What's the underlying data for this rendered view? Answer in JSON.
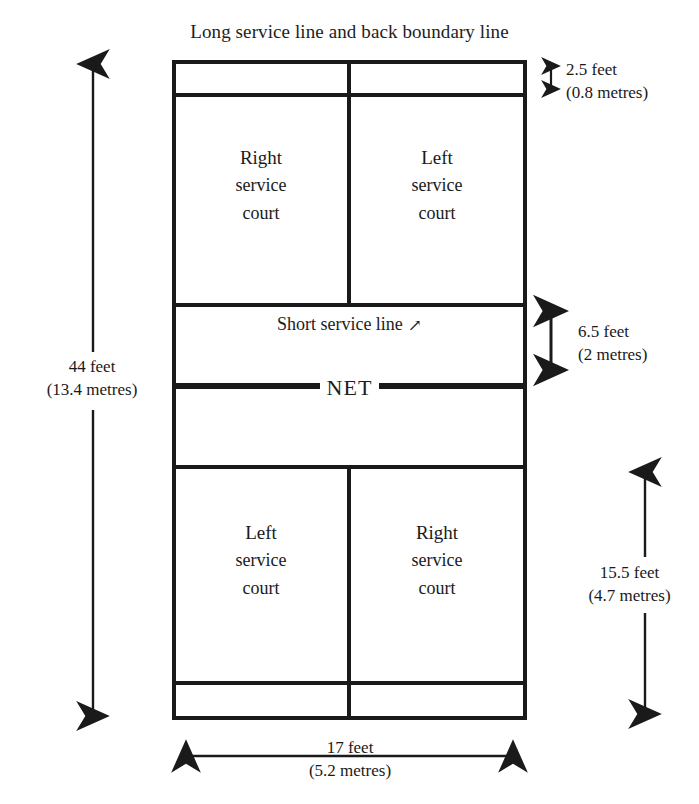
{
  "title": "Long service line and back boundary line",
  "net_label": "NET",
  "short_service_annotation": {
    "text": "Short service line",
    "arrow_glyph": "↗",
    "arrow_icon": "arrow-up-right-icon"
  },
  "court_labels": {
    "top_left": {
      "line1": "Right",
      "line2": "service",
      "line3": "court"
    },
    "top_right": {
      "line1": "Left",
      "line2": "service",
      "line3": "court"
    },
    "bottom_left": {
      "line1": "Left",
      "line2": "service",
      "line3": "court"
    },
    "bottom_right": {
      "line1": "Right",
      "line2": "service",
      "line3": "court"
    }
  },
  "dimensions": {
    "back_alley": {
      "feet": "2.5 feet",
      "metres": "(0.8 metres)"
    },
    "service_zone": {
      "feet": "6.5 feet",
      "metres": "(2 metres)"
    },
    "half_court": {
      "feet": "15.5 feet",
      "metres": "(4.7 metres)"
    },
    "length": {
      "feet": "44 feet",
      "metres": "(13.4 metres)"
    },
    "width": {
      "feet": "17 feet",
      "metres": "(5.2 metres)"
    }
  },
  "colors": {
    "line": "#1a1a1a",
    "text": "#1d1d1d",
    "background": "#ffffff"
  }
}
